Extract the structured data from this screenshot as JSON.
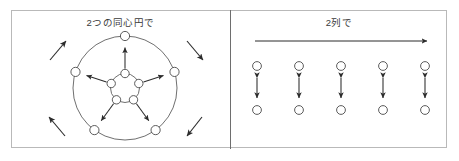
{
  "figure": {
    "panels": [
      {
        "id": "concentric-circles",
        "title": "2つの同心円で",
        "layout_type": "two-concentric-circles",
        "node_count_outer": 5,
        "node_count_inner": 5,
        "rotation_hint_arrows": 4,
        "rotation_direction": "counter-clockwise",
        "pair_arrows": "double-headed radial arrows between inner and outer nodes"
      },
      {
        "id": "two-rows",
        "title": "2列で",
        "layout_type": "two-parallel-rows",
        "columns": 5,
        "rows": 2,
        "direction_arrow": "horizontal right arrow above the rows",
        "pair_arrows": "vertical double-headed arrows between paired nodes"
      }
    ],
    "colors": {
      "frame": "#b9b9b9",
      "divider": "#6e6e6e",
      "stroke": "#3a3a3a",
      "node_stroke": "#5a5a5a",
      "node_fill": "#ffffff",
      "text": "#3a3a3a",
      "background": "#ffffff"
    }
  }
}
